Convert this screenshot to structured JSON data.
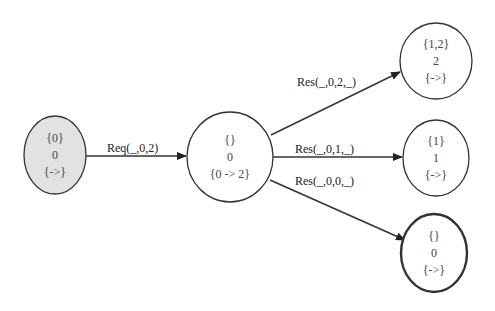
{
  "diagram": {
    "type": "state-graph",
    "nodes": [
      {
        "id": "s0",
        "line1": "{0}",
        "line2": "0",
        "line3": "{->}",
        "style": "initial",
        "fill": "#e2e2e2"
      },
      {
        "id": "s1",
        "line1": "{}",
        "line2": "0",
        "line3": "{0 -> 2}",
        "style": "normal"
      },
      {
        "id": "s2",
        "line1": "{1,2}",
        "line2": "2",
        "line3": "{->}",
        "style": "normal"
      },
      {
        "id": "s3",
        "line1": "{1}",
        "line2": "1",
        "line3": "{->}",
        "style": "normal"
      },
      {
        "id": "s4",
        "line1": "{}",
        "line2": "0",
        "line3": "{->}",
        "style": "final-bold"
      }
    ],
    "edges": [
      {
        "from": "s0",
        "to": "s1",
        "label": "Req(_,0,2)"
      },
      {
        "from": "s1",
        "to": "s2",
        "label": "Res(_,0,2,_)"
      },
      {
        "from": "s1",
        "to": "s3",
        "label": "Res(_,0,1,_)"
      },
      {
        "from": "s1",
        "to": "s4",
        "label": "Res(_,0,0,_)"
      }
    ]
  }
}
